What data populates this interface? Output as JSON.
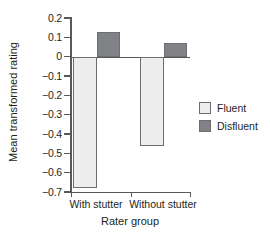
{
  "chart_data": {
    "type": "bar",
    "title": "",
    "xlabel": "Rater group",
    "ylabel": "Mean transformed rating",
    "categories": [
      "With stutter",
      "Without stutter"
    ],
    "series": [
      {
        "name": "Fluent",
        "color": "#ededed",
        "values": [
          -0.68,
          -0.46
        ]
      },
      {
        "name": "Disfluent",
        "color": "#808285",
        "values": [
          0.13,
          0.07
        ]
      }
    ],
    "ylim": [
      -0.7,
      0.2
    ],
    "yticks": [
      0.2,
      0.1,
      0,
      -0.1,
      -0.2,
      -0.3,
      -0.4,
      -0.5,
      -0.6,
      -0.7
    ],
    "ytick_labels": [
      "0.2",
      "0.1",
      "0",
      "−0.1",
      "−0.2",
      "−0.3",
      "−0.4",
      "−0.5",
      "−0.6",
      "−0.7"
    ],
    "grid": false,
    "legend_position": "right",
    "zero_line": true
  },
  "legend": {
    "items": [
      {
        "label": "Fluent"
      },
      {
        "label": "Disfluent"
      }
    ]
  },
  "axes": {
    "y_title": "Mean transformed rating",
    "x_title": "Rater group"
  }
}
